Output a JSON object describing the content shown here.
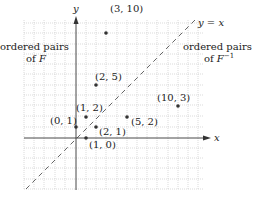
{
  "axes": {
    "x_label": "x",
    "y_label": "y"
  },
  "line": {
    "label": "y = x",
    "style": "dashed"
  },
  "annotations": {
    "left_line1": "ordered pairs",
    "left_line2_prefix": "of ",
    "left_line2_symbol": "F",
    "right_line1": "ordered pairs",
    "right_line2_prefix": "of ",
    "right_line2_symbol": "F",
    "right_line2_superscript": "−1"
  },
  "points": [
    {
      "label": "(3, 10)",
      "x": 3,
      "y": 10
    },
    {
      "label": "(2, 5)",
      "x": 2,
      "y": 5
    },
    {
      "label": "(1, 2)",
      "x": 1,
      "y": 2
    },
    {
      "label": "(0, 1)",
      "x": 0,
      "y": 1
    },
    {
      "label": "(2, 1)",
      "x": 2,
      "y": 1
    },
    {
      "label": "(1, 0)",
      "x": 1,
      "y": 0
    },
    {
      "label": "(5, 2)",
      "x": 5,
      "y": 2
    },
    {
      "label": "(10, 3)",
      "x": 10,
      "y": 3
    }
  ],
  "colors": {
    "grid": "#b8b8b8",
    "axis": "#333333",
    "point": "#333333",
    "dashed_line": "#555555"
  }
}
